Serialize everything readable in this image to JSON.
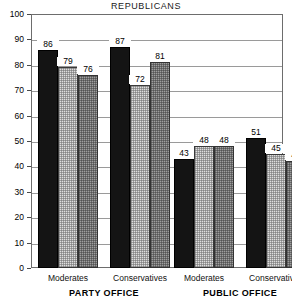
{
  "chart_data": {
    "type": "bar",
    "title": "REPUBLICANS",
    "xlabel": "",
    "ylabel": "",
    "ylim": [
      0,
      100
    ],
    "yticks": [
      0,
      10,
      20,
      30,
      40,
      50,
      60,
      70,
      80,
      90,
      100
    ],
    "ytick_labels": [
      "0",
      "10",
      "20",
      "30",
      "40",
      "50",
      "60",
      "70",
      "80",
      "90",
      "100"
    ],
    "grid": true,
    "legend": "none",
    "categories": [
      "Moderates",
      "Conservatives",
      "Moderates",
      "Conservatives"
    ],
    "group_labels": [
      "PARTY OFFICE",
      "PUBLIC OFFICE"
    ],
    "series": [
      {
        "name": "series-1",
        "style": "solid-black",
        "values": [
          86,
          87,
          43,
          51
        ]
      },
      {
        "name": "series-2",
        "style": "light-stipple",
        "values": [
          79,
          72,
          48,
          45
        ]
      },
      {
        "name": "series-3",
        "style": "gray-stipple",
        "values": [
          76,
          81,
          48,
          42
        ]
      }
    ],
    "groups": [
      {
        "category": "Moderates",
        "section": "PARTY OFFICE",
        "bars": [
          {
            "value": 86,
            "label": "86",
            "style": "solid-black"
          },
          {
            "value": 79,
            "label": "79",
            "style": "light-stipple"
          },
          {
            "value": 76,
            "label": "76",
            "style": "gray-stipple"
          }
        ]
      },
      {
        "category": "Conservatives",
        "section": "PARTY OFFICE",
        "bars": [
          {
            "value": 87,
            "label": "87",
            "style": "solid-black"
          },
          {
            "value": 72,
            "label": "72",
            "style": "light-stipple"
          },
          {
            "value": 81,
            "label": "81",
            "style": "gray-stipple"
          }
        ]
      },
      {
        "category": "Moderates",
        "section": "PUBLIC OFFICE",
        "bars": [
          {
            "value": 43,
            "label": "43",
            "style": "solid-black"
          },
          {
            "value": 48,
            "label": "48",
            "style": "light-stipple"
          },
          {
            "value": 48,
            "label": "48",
            "style": "gray-stipple"
          }
        ]
      },
      {
        "category": "Conservatives",
        "section": "PUBLIC OFFICE",
        "bars": [
          {
            "value": 51,
            "label": "51",
            "style": "solid-black"
          },
          {
            "value": 45,
            "label": "45",
            "style": "light-stipple"
          },
          {
            "value": 42,
            "label": "42",
            "style": "gray-stipple"
          }
        ]
      }
    ],
    "colors": {
      "solid-black": "#141414",
      "light-stipple": "#dedede",
      "gray-stipple": "#9e9e9e",
      "gridline": "#9a9a9a",
      "frame": "#6d6d6d",
      "background": "#ffffff",
      "text": "#000000"
    }
  }
}
